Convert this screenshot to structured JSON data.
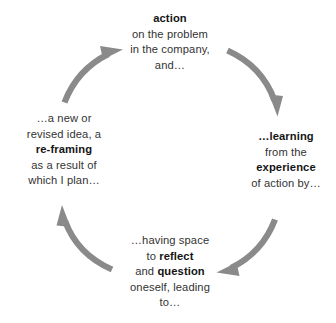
{
  "diagram": {
    "type": "cycle",
    "orientation": "clockwise",
    "background_color": "#ffffff",
    "arrow_color": "#8a8a8a",
    "text_color": "#333333",
    "bold_text_color": "#141414",
    "nodes": [
      {
        "id": "action",
        "position": "top",
        "lines": [
          {
            "text": "action",
            "bold": true
          },
          {
            "text": "on the problem",
            "bold": false
          },
          {
            "text": "in the company,",
            "bold": false
          },
          {
            "text": "and…",
            "bold": false
          }
        ]
      },
      {
        "id": "learning",
        "position": "right",
        "lines": [
          {
            "text": "…learning",
            "bold": true
          },
          {
            "text": "from the",
            "bold": false
          },
          {
            "text": "experience",
            "bold": true
          },
          {
            "text": "of action by…",
            "bold": false
          }
        ]
      },
      {
        "id": "reflect",
        "position": "bottom",
        "lines": [
          {
            "text": "…having space",
            "bold": false
          },
          {
            "text": "to reflect",
            "bold": "mixed",
            "plain_prefix": "to ",
            "bold_part": "reflect",
            "plain_suffix": ""
          },
          {
            "text": "and question",
            "bold": "mixed",
            "plain_prefix": "and ",
            "bold_part": "question",
            "plain_suffix": ""
          },
          {
            "text": "oneself, leading",
            "bold": false
          },
          {
            "text": "to…",
            "bold": false
          }
        ]
      },
      {
        "id": "reframing",
        "position": "left",
        "lines": [
          {
            "text": "…a new or",
            "bold": false
          },
          {
            "text": "revised idea, a",
            "bold": false
          },
          {
            "text": "re-framing",
            "bold": true
          },
          {
            "text": "as a result of",
            "bold": false
          },
          {
            "text": "which I plan…",
            "bold": false
          }
        ]
      }
    ],
    "arrows": [
      {
        "id": "action-to-learning",
        "from": "action",
        "to": "learning",
        "quadrant": "top-right"
      },
      {
        "id": "learning-to-reflect",
        "from": "learning",
        "to": "reflect",
        "quadrant": "bottom-right"
      },
      {
        "id": "reflect-to-reframing",
        "from": "reflect",
        "to": "reframing",
        "quadrant": "bottom-left"
      },
      {
        "id": "reframing-to-action",
        "from": "reframing",
        "to": "action",
        "quadrant": "top-left"
      }
    ]
  },
  "nodes": {
    "action": {
      "l0": "action",
      "l1": "on the problem",
      "l2": "in the company,",
      "l3": "and…"
    },
    "learning": {
      "l0": "…learning",
      "l1": "from the",
      "l2": "experience",
      "l3": "of action by…"
    },
    "reflect": {
      "l0": "…having space",
      "l1a": "to ",
      "l1b": "reflect",
      "l2a": "and ",
      "l2b": "question",
      "l3": "oneself, leading",
      "l4": "to…"
    },
    "reframing": {
      "l0": "…a new or",
      "l1": "revised idea, a",
      "l2": "re-framing",
      "l3": "as a result of",
      "l4": "which I plan…"
    }
  }
}
